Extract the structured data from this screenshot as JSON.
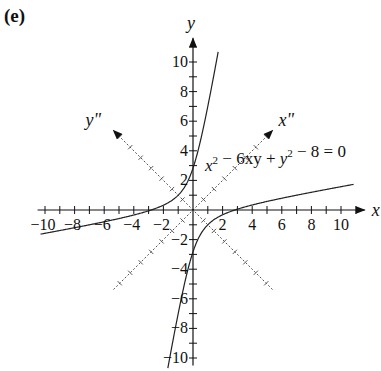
{
  "panel_label": "(e)",
  "chart_data": {
    "type": "line",
    "title": "",
    "equation": "x^2 - 6xy + y^2 - 8 = 0",
    "equation_parts": {
      "a": "x",
      "a_exp": "2",
      "b": " − 6xy + ",
      "c": "y",
      "c_exp": "2",
      "d": " − 8 = 0"
    },
    "xlabel": "x",
    "ylabel": "y",
    "rotated_axes": [
      {
        "label": "x\"",
        "direction_deg": 45
      },
      {
        "label": "y\"",
        "direction_deg": 135
      }
    ],
    "xlim": [
      -10,
      11
    ],
    "ylim": [
      -10,
      11
    ],
    "x_ticks": [
      "-10",
      "-8",
      "-6",
      "-4",
      "-2",
      "2",
      "4",
      "6",
      "8",
      "10"
    ],
    "y_ticks": [
      "10",
      "8",
      "6",
      "4",
      "2",
      "-2",
      "-4",
      "-6",
      "-8",
      "-10"
    ],
    "grid": false,
    "series": [
      {
        "name": "hyperbola branch 1 (upper-left)",
        "x": [
          -11,
          -8,
          -6,
          -4,
          -3.06,
          -2,
          -1,
          0,
          0.5,
          1,
          1.5,
          2.11
        ],
        "y": [
          -1.68,
          -1.05,
          -0.8,
          -0.3,
          0,
          0.62,
          1.35,
          2.83,
          3.57,
          4.41,
          5.38,
          11
        ]
      },
      {
        "name": "hyperbola branch 2 (lower-right)",
        "x": [
          11,
          8,
          6,
          4,
          3.06,
          2,
          1,
          0,
          -0.5,
          -1,
          -1.5,
          -2.11
        ],
        "y": [
          1.68,
          1.05,
          0.8,
          0.3,
          0,
          -0.62,
          -1.35,
          -2.83,
          -3.57,
          -4.41,
          -5.38,
          -11
        ]
      }
    ]
  }
}
